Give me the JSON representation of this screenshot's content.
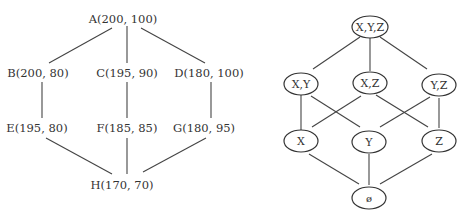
{
  "left_lattice": {
    "nodes": [
      {
        "id": "A",
        "label": "A(200, 100)"
      },
      {
        "id": "B",
        "label": "B(200, 80)"
      },
      {
        "id": "C",
        "label": "C(195, 90)"
      },
      {
        "id": "D",
        "label": "D(180, 100)"
      },
      {
        "id": "E",
        "label": "E(195, 80)"
      },
      {
        "id": "F",
        "label": "F(185, 85)"
      },
      {
        "id": "G",
        "label": "G(180, 95)"
      },
      {
        "id": "H",
        "label": "H(170, 70)"
      }
    ],
    "edges": [
      [
        "A",
        "B"
      ],
      [
        "A",
        "C"
      ],
      [
        "A",
        "D"
      ],
      [
        "B",
        "E"
      ],
      [
        "C",
        "F"
      ],
      [
        "D",
        "G"
      ],
      [
        "E",
        "H"
      ],
      [
        "F",
        "H"
      ],
      [
        "G",
        "H"
      ]
    ]
  },
  "right_lattice": {
    "nodes": [
      {
        "id": "XYZ",
        "label": "X,Y,Z"
      },
      {
        "id": "XY",
        "label": "X,Y"
      },
      {
        "id": "XZ",
        "label": "X,Z"
      },
      {
        "id": "YZ",
        "label": "Y,Z"
      },
      {
        "id": "X",
        "label": "X"
      },
      {
        "id": "Y",
        "label": "Y"
      },
      {
        "id": "Z",
        "label": "Z"
      },
      {
        "id": "empty",
        "label": "ø"
      }
    ],
    "edges": [
      [
        "XYZ",
        "XY"
      ],
      [
        "XYZ",
        "XZ"
      ],
      [
        "XYZ",
        "YZ"
      ],
      [
        "XY",
        "X"
      ],
      [
        "XY",
        "Y"
      ],
      [
        "XZ",
        "X"
      ],
      [
        "XZ",
        "Z"
      ],
      [
        "YZ",
        "Y"
      ],
      [
        "YZ",
        "Z"
      ],
      [
        "X",
        "empty"
      ],
      [
        "Y",
        "empty"
      ],
      [
        "Z",
        "empty"
      ]
    ]
  }
}
